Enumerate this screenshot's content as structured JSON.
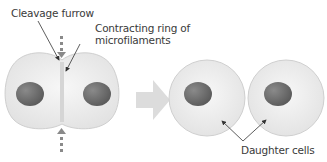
{
  "labels": {
    "cleavage_furrow": "Cleavage furrow",
    "contracting_ring_line1": "Contracting ring of",
    "contracting_ring_line2": "microfilaments",
    "daughter_cells": "Daughter cells"
  },
  "colors": {
    "cytoplasm": "#ececec",
    "cell_outline": "#cfcfcf",
    "nucleus": "#707070",
    "arrow": "#d9d9d9",
    "dashed_arrow": "#8a8a8a",
    "leader_line": "#333333",
    "text": "#3a3a3a"
  }
}
